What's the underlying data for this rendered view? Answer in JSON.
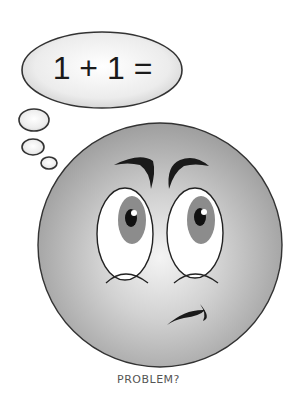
{
  "thought_bubble": {
    "text": "1 + 1 ="
  },
  "face": {
    "expression": "confused"
  },
  "caption": "PROBLEM?",
  "colors": {
    "face_fill": "#b8b8b8",
    "face_highlight": "#f2f2f2",
    "iris": "#8c8c8c",
    "pupil": "#111111",
    "outline": "#222222"
  }
}
